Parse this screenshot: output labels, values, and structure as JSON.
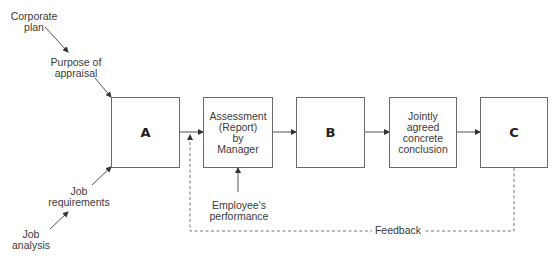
{
  "inputs": {
    "corporate_plan": [
      "Corporate",
      "plan"
    ],
    "purpose_of_appraisal": [
      "Purpose of",
      "appraisal"
    ],
    "job_requirements": [
      "Job",
      "requirements"
    ],
    "job_analysis": [
      "Job",
      "analysis"
    ],
    "employees_performance": [
      "Employee's",
      "performance"
    ]
  },
  "boxes": [
    {
      "id": "A",
      "label": "A"
    },
    {
      "id": "assessment",
      "lines": [
        "Assessment",
        "(Report)",
        "by",
        "Manager"
      ]
    },
    {
      "id": "B",
      "label": "B"
    },
    {
      "id": "jointly",
      "lines": [
        "Jointly",
        "agreed",
        "concrete",
        "conclusion"
      ]
    },
    {
      "id": "C",
      "label": "C"
    }
  ],
  "feedback": {
    "label": "Feedback"
  },
  "colors": {
    "line": "#6a6a6a",
    "text": "#3a3a3a",
    "background": "#ffffff"
  }
}
